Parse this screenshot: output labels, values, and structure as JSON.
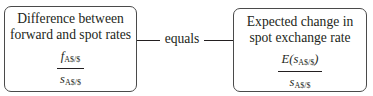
{
  "diagram": {
    "left_box": {
      "title_line1": "Difference between",
      "title_line2": "forward and spot rates",
      "numerator_var": "f",
      "numerator_sub": "A$/$",
      "denominator_var": "s",
      "denominator_sub": "A$/$"
    },
    "connector": {
      "label": "equals"
    },
    "right_box": {
      "title_line1": "Expected change in",
      "title_line2": "spot exchange rate",
      "numerator_prefix": "E(",
      "numerator_var": "s",
      "numerator_sub": "A$/$",
      "numerator_suffix": ")",
      "denominator_var": "s",
      "denominator_sub": "A$/$"
    }
  }
}
